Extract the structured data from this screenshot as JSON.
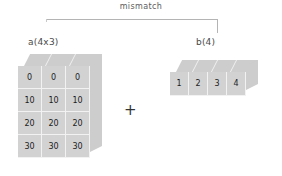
{
  "diagram": {
    "annotation": {
      "label": "mismatch",
      "connector": "bracket"
    },
    "operator": "+",
    "blocks": [
      {
        "id": "a",
        "label": "a(4x3)",
        "shape": "4x3",
        "rows": 4,
        "cols": 3,
        "values": [
          [
            "0",
            "0",
            "0"
          ],
          [
            "10",
            "10",
            "10"
          ],
          [
            "20",
            "20",
            "20"
          ],
          [
            "30",
            "30",
            "30"
          ]
        ]
      },
      {
        "id": "b",
        "label": "b(4)",
        "shape": "4",
        "rows": 1,
        "cols": 4,
        "values": [
          [
            "1",
            "2",
            "3",
            "4"
          ]
        ]
      }
    ]
  },
  "colors": {
    "block_fill": "#d2d2d2",
    "block_face": "#cdcdcd",
    "grid_line": "#f2f2f2",
    "connector": "#b4b4b4",
    "text": "#1c1c1c",
    "label_text": "#4a4a4a",
    "annotation_text": "#5d5d5d",
    "background": "#ffffff"
  }
}
